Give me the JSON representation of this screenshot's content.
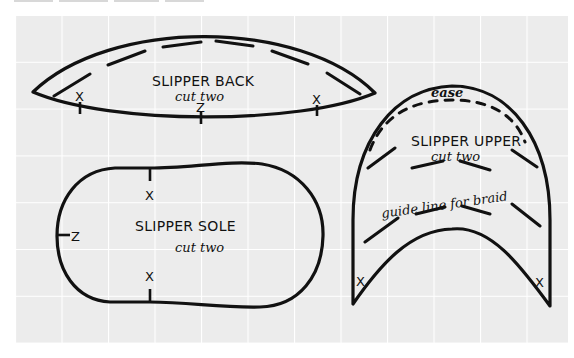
{
  "figure": {
    "type": "sewing-pattern",
    "background": {
      "grid_fill": "#ececec",
      "grid_line": "#ffffff",
      "page": "#ffffff",
      "ink": "#111111"
    },
    "grid": {
      "x0": 15,
      "y0": 15,
      "x1": 568,
      "y1": 343,
      "cell": 46.5
    }
  },
  "pieces": {
    "back": {
      "title": "SLIPPER BACK",
      "subtitle": "cut two",
      "marks": {
        "left_x": "X",
        "center_z": "Z",
        "right_x": "X"
      }
    },
    "sole": {
      "title": "SLIPPER SOLE",
      "subtitle": "cut two",
      "marks": {
        "top_x": "X",
        "left_z": "Z",
        "bottom_x": "X"
      }
    },
    "upper": {
      "title": "SLIPPER UPPER",
      "subtitle": "cut two",
      "ease_label": "ease",
      "guide_label": "guide line for braid",
      "marks": {
        "left_x": "X",
        "right_x": "X"
      }
    }
  }
}
